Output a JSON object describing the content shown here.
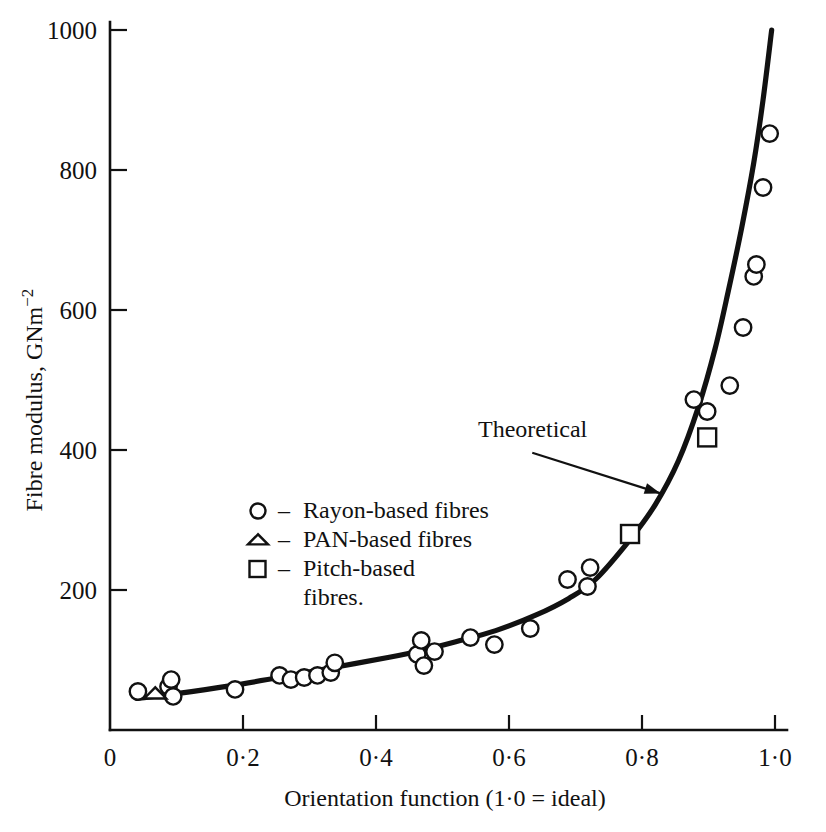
{
  "chart_data": {
    "type": "scatter",
    "title": "",
    "xlabel": "Orientation function (1·0 = ideal)",
    "ylabel": "Fibre modulus, GNm⁻²",
    "xlim": [
      0,
      1.0
    ],
    "ylim": [
      0,
      1000
    ],
    "grid": false,
    "x_ticks": [
      0,
      0.2,
      0.4,
      0.6,
      0.8,
      1.0
    ],
    "x_tick_labels": [
      "0",
      "0·2",
      "0·4",
      "0·6",
      "0·8",
      "1·0"
    ],
    "y_ticks": [
      200,
      400,
      600,
      800,
      1000
    ],
    "y_tick_labels": [
      "200",
      "400",
      "600",
      "800",
      "1000"
    ],
    "legend_position": "inside-left-middle",
    "series": [
      {
        "name": "Rayon-based fibres",
        "marker": "circle",
        "points": [
          [
            0.042,
            55
          ],
          [
            0.088,
            62
          ],
          [
            0.095,
            48
          ],
          [
            0.092,
            72
          ],
          [
            0.188,
            58
          ],
          [
            0.255,
            78
          ],
          [
            0.272,
            72
          ],
          [
            0.292,
            75
          ],
          [
            0.312,
            78
          ],
          [
            0.332,
            82
          ],
          [
            0.338,
            96
          ],
          [
            0.462,
            108
          ],
          [
            0.468,
            128
          ],
          [
            0.472,
            92
          ],
          [
            0.488,
            112
          ],
          [
            0.542,
            132
          ],
          [
            0.578,
            122
          ],
          [
            0.632,
            145
          ],
          [
            0.688,
            215
          ],
          [
            0.722,
            232
          ],
          [
            0.718,
            205
          ],
          [
            0.878,
            472
          ],
          [
            0.898,
            455
          ],
          [
            0.932,
            492
          ],
          [
            0.952,
            575
          ],
          [
            0.968,
            648
          ],
          [
            0.972,
            665
          ],
          [
            0.982,
            775
          ],
          [
            0.992,
            852
          ]
        ]
      },
      {
        "name": "PAN-based fibres",
        "marker": "triangle",
        "points": [
          [
            0.068,
            52
          ]
        ]
      },
      {
        "name": "Pitch-based fibres.",
        "marker": "square",
        "points": [
          [
            0.782,
            280
          ],
          [
            0.898,
            418
          ]
        ]
      }
    ],
    "theoretical_curve": {
      "label": "Theoretical",
      "points": [
        [
          0.04,
          45
        ],
        [
          0.1,
          52
        ],
        [
          0.18,
          63
        ],
        [
          0.26,
          76
        ],
        [
          0.34,
          90
        ],
        [
          0.42,
          104
        ],
        [
          0.47,
          114
        ],
        [
          0.52,
          126
        ],
        [
          0.58,
          142
        ],
        [
          0.64,
          164
        ],
        [
          0.69,
          188
        ],
        [
          0.73,
          215
        ],
        [
          0.782,
          272
        ],
        [
          0.82,
          322
        ],
        [
          0.855,
          385
        ],
        [
          0.885,
          462
        ],
        [
          0.91,
          545
        ],
        [
          0.93,
          628
        ],
        [
          0.95,
          718
        ],
        [
          0.968,
          810
        ],
        [
          0.982,
          900
        ],
        [
          0.995,
          1000
        ]
      ]
    },
    "annotation": {
      "text": "Theoretical",
      "arrow_from": [
        0.635,
        396
      ],
      "arrow_to": [
        0.828,
        338
      ]
    }
  },
  "legend": {
    "dash": "–",
    "entries": [
      {
        "marker": "circle",
        "label": "Rayon-based fibres"
      },
      {
        "marker": "triangle",
        "label": "PAN-based fibres"
      },
      {
        "marker": "square",
        "label": "Pitch-based"
      },
      {
        "marker": "none",
        "label": "fibres."
      }
    ]
  },
  "style": {
    "ink": "#111111",
    "paper": "#ffffff"
  }
}
